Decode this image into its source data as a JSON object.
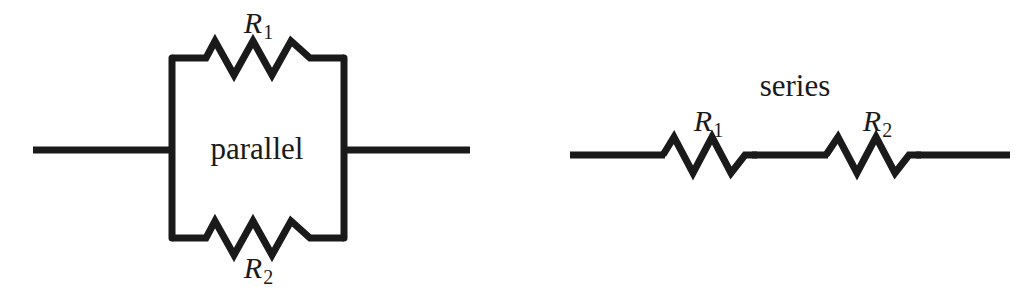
{
  "figure": {
    "title_visible": false,
    "background_color": "#ffffff",
    "line_color": "#1a1a1a",
    "width": 1029,
    "height": 294
  },
  "circuits": [
    {
      "id": "parallel-circuit",
      "name": "parallel",
      "center_label": "parallel",
      "resistors": [
        {
          "id": "parallel-r1",
          "label_symbol": "R",
          "label_subscript": "1",
          "position": "top-branch"
        },
        {
          "id": "parallel-r2",
          "label_symbol": "R",
          "label_subscript": "2",
          "position": "bottom-branch"
        }
      ],
      "leads": [
        {
          "id": "parallel-left-lead",
          "side": "left"
        },
        {
          "id": "parallel-right-lead",
          "side": "right"
        }
      ]
    },
    {
      "id": "series-circuit",
      "name": "series",
      "center_label": "series",
      "resistors": [
        {
          "id": "series-r1",
          "label_symbol": "R",
          "label_subscript": "1",
          "position": "left"
        },
        {
          "id": "series-r2",
          "label_symbol": "R",
          "label_subscript": "2",
          "position": "right"
        }
      ],
      "leads": [
        {
          "id": "series-left-lead",
          "side": "left"
        },
        {
          "id": "series-middle-lead",
          "side": "middle"
        },
        {
          "id": "series-right-lead",
          "side": "right"
        }
      ]
    }
  ],
  "labels": {
    "parallel_r1_symbol": "R",
    "parallel_r1_subscript": "1",
    "parallel_r2_symbol": "R",
    "parallel_r2_subscript": "2",
    "parallel_center": "parallel",
    "series_title": "series",
    "series_r1_symbol": "R",
    "series_r1_subscript": "1",
    "series_r2_symbol": "R",
    "series_r2_subscript": "2"
  }
}
